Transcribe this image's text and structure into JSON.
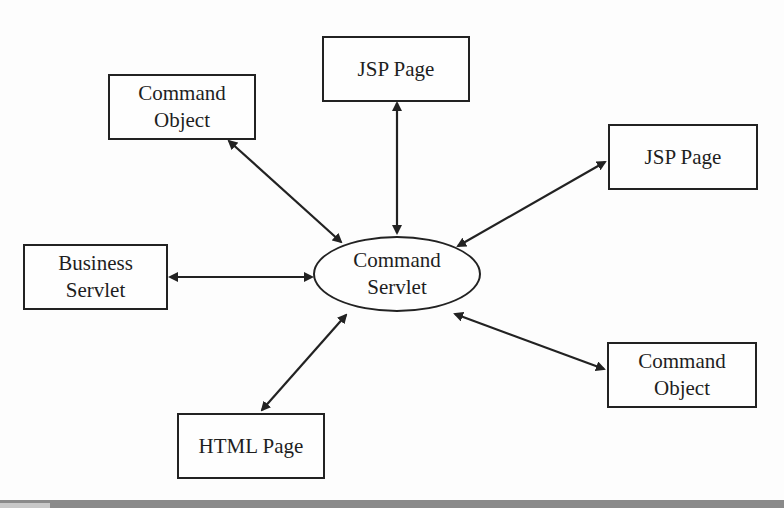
{
  "diagram": {
    "center": {
      "line1": "Command",
      "line2": "Servlet"
    },
    "nodes": [
      {
        "id": "command-object-top",
        "line1": "Command",
        "line2": "Object"
      },
      {
        "id": "jsp-page-top",
        "line1": "JSP Page"
      },
      {
        "id": "jsp-page-right",
        "line1": "JSP Page"
      },
      {
        "id": "business-servlet",
        "line1": "Business",
        "line2": "Servlet"
      },
      {
        "id": "html-page",
        "line1": "HTML Page"
      },
      {
        "id": "command-object-bottom",
        "line1": "Command",
        "line2": "Object"
      }
    ],
    "edges": [
      {
        "from": "Command Object",
        "to": "Command Servlet",
        "direction": "bidirectional"
      },
      {
        "from": "JSP Page",
        "to": "Command Servlet",
        "direction": "bidirectional"
      },
      {
        "from": "JSP Page",
        "to": "Command Servlet",
        "direction": "bidirectional"
      },
      {
        "from": "Business Servlet",
        "to": "Command Servlet",
        "direction": "bidirectional"
      },
      {
        "from": "HTML Page",
        "to": "Command Servlet",
        "direction": "bidirectional"
      },
      {
        "from": "Command Object",
        "to": "Command Servlet",
        "direction": "bidirectional"
      }
    ],
    "colors": {
      "stroke": "#222222",
      "background": "#fdfdfd",
      "bottom_bar": "#8a8a8a"
    }
  }
}
